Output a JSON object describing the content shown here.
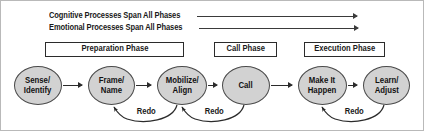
{
  "diagram": {
    "title_spans": [
      {
        "id": "cognitive",
        "label": "Cognitive Processes Span All Phases",
        "arrow": "right-arrow-icon"
      },
      {
        "id": "emotional",
        "label": "Emotional Processes Span All Phases",
        "arrow": "right-arrow-icon"
      }
    ],
    "phases": [
      {
        "id": "preparation",
        "label": "Preparation Phase"
      },
      {
        "id": "call",
        "label": "Call Phase"
      },
      {
        "id": "execution",
        "label": "Execution Phase"
      }
    ],
    "nodes": [
      {
        "id": "sense-identify",
        "label": "Sense/\nIdentify"
      },
      {
        "id": "frame-name",
        "label": "Frame/\nName"
      },
      {
        "id": "mobilize-align",
        "label": "Mobilize/\nAlign"
      },
      {
        "id": "call",
        "label": "Call"
      },
      {
        "id": "make-it-happen",
        "label": "Make It\nHappen"
      },
      {
        "id": "learn-adjust",
        "label": "Learn/\nAdjust"
      }
    ],
    "flow_arrows": [
      {
        "id": "sense-to-frame",
        "icon": "right-arrow-icon"
      },
      {
        "id": "frame-to-mobilize",
        "icon": "right-arrow-icon"
      },
      {
        "id": "mobilize-to-call",
        "icon": "right-arrow-icon"
      },
      {
        "id": "call-to-make-it-happen",
        "icon": "right-arrow-icon"
      },
      {
        "id": "make-it-happen-to-learn",
        "icon": "right-arrow-icon"
      }
    ],
    "redo_arcs": [
      {
        "id": "redo-mobilize-to-frame",
        "label": "Redo"
      },
      {
        "id": "redo-call-to-mobilize",
        "label": "Redo"
      },
      {
        "id": "redo-learn-to-make-it-happen",
        "label": "Redo"
      }
    ],
    "colors": {
      "node_fill": "#d2d2d2",
      "node_stroke": "#4a4a4a",
      "box_stroke": "#2b2b2b",
      "line": "#3a3a3a",
      "text": "#111111",
      "frame": "#b9b9b9",
      "background": "#ffffff"
    }
  }
}
